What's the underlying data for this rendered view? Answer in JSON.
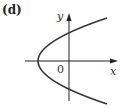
{
  "panel_label": "(d)",
  "axes": {
    "x_label": "x",
    "y_label": "y",
    "origin_label": "0"
  },
  "curve": {
    "description": "parabola opening to the right, vertex left of origin",
    "stroke_color": "#333333"
  },
  "colors": {
    "axis": "#222222",
    "curve": "#333333",
    "text": "#333333"
  }
}
